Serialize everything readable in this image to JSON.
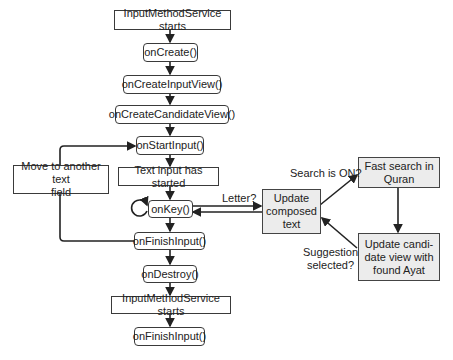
{
  "diagram": {
    "type": "flowchart",
    "nodes": {
      "ims_start_1": "InputMethodService starts",
      "on_create": "onCreate()",
      "on_create_input_view": "onCreateInputView()",
      "on_create_candidate_view": "onCreateCandidateView()",
      "on_start_input": "onStartInput()",
      "text_input_started": "Text input has started",
      "on_key": "onKey()",
      "on_finish_input_1": "onFinishInput()",
      "on_destroy": "onDestroy()",
      "ims_start_2": "InputMethodService starts",
      "on_finish_input_2": "onFinishInput()",
      "move_to_field": "Move to another text field",
      "update_composed": "Update composed text",
      "fast_search": "Fast search in Quran",
      "update_candidate": "Update candi-date view with found Ayat"
    },
    "node_lines": {
      "move_to_field": [
        "Move to another text",
        "field"
      ],
      "update_composed": [
        "Update",
        "composed",
        "text"
      ],
      "fast_search": [
        "Fast search in",
        "Quran"
      ],
      "update_candidate": [
        "Update candi-",
        "date view with",
        "found Ayat"
      ]
    },
    "edge_labels": {
      "letter": "Letter?",
      "search_on": "Search is ON?",
      "suggestion_selected": [
        "Suggestion",
        "selected?"
      ]
    },
    "edges": [
      {
        "from": "ims_start_1",
        "to": "on_create"
      },
      {
        "from": "on_create",
        "to": "on_create_input_view"
      },
      {
        "from": "on_create_input_view",
        "to": "on_create_candidate_view"
      },
      {
        "from": "on_create_candidate_view",
        "to": "on_start_input"
      },
      {
        "from": "on_start_input",
        "to": "text_input_started"
      },
      {
        "from": "text_input_started",
        "to": "on_key"
      },
      {
        "from": "on_key",
        "to": "on_key",
        "kind": "self-loop"
      },
      {
        "from": "on_key",
        "to": "update_composed",
        "label": "Letter?"
      },
      {
        "from": "update_composed",
        "to": "on_key"
      },
      {
        "from": "update_composed",
        "to": "fast_search",
        "label": "Search is ON?"
      },
      {
        "from": "fast_search",
        "to": "update_candidate"
      },
      {
        "from": "update_candidate",
        "to": "update_composed",
        "label": "Suggestion selected?"
      },
      {
        "from": "on_key",
        "to": "on_finish_input_1"
      },
      {
        "from": "on_finish_input_1",
        "to": "move_to_field"
      },
      {
        "from": "move_to_field",
        "to": "on_start_input"
      },
      {
        "from": "on_finish_input_1",
        "to": "on_destroy"
      },
      {
        "from": "on_destroy",
        "to": "ims_start_2"
      },
      {
        "from": "ims_start_2",
        "to": "on_finish_input_2"
      }
    ],
    "colors": {
      "stroke": "#222222",
      "node_fill": "#ffffff",
      "highlight_fill": "#ececec"
    }
  }
}
